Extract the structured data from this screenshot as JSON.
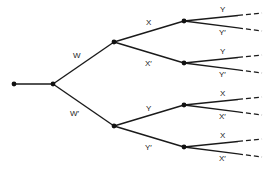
{
  "diagram": {
    "type": "probability-tree",
    "colors": {
      "line": "#1a1a1a",
      "node": "#111111",
      "label": "#222222",
      "background": "#ffffff"
    },
    "nodes": [
      {
        "id": "root",
        "x": 14,
        "y": 84
      },
      {
        "id": "split",
        "x": 53,
        "y": 84
      },
      {
        "id": "W",
        "x": 114,
        "y": 42
      },
      {
        "id": "Wp",
        "x": 114,
        "y": 126
      },
      {
        "id": "WX",
        "x": 184,
        "y": 21
      },
      {
        "id": "WXp",
        "x": 184,
        "y": 63
      },
      {
        "id": "WpY",
        "x": 184,
        "y": 105
      },
      {
        "id": "WpYp",
        "x": 184,
        "y": 147
      }
    ],
    "edges": [
      {
        "from": "root",
        "to": "split",
        "label": ""
      },
      {
        "from": "split",
        "to": "W",
        "label": "W",
        "lx": 73,
        "ly": 58
      },
      {
        "from": "split",
        "to": "Wp",
        "label": "W′",
        "lx": 70,
        "ly": 116
      },
      {
        "from": "W",
        "to": "WX",
        "label": "X",
        "lx": 146,
        "ly": 25
      },
      {
        "from": "W",
        "to": "WXp",
        "label": "X′",
        "lx": 145,
        "ly": 66
      },
      {
        "from": "Wp",
        "to": "WpY",
        "label": "Y",
        "lx": 146,
        "ly": 111
      },
      {
        "from": "Wp",
        "to": "WpYp",
        "label": "Y′",
        "lx": 145,
        "ly": 150
      }
    ],
    "leaves": [
      {
        "parent": "WX",
        "label": "Y",
        "y_end": 13,
        "lx": 220,
        "ly": 12
      },
      {
        "parent": "WX",
        "label": "Y′",
        "y_end": 31,
        "lx": 219,
        "ly": 35
      },
      {
        "parent": "WXp",
        "label": "Y",
        "y_end": 55,
        "lx": 220,
        "ly": 54
      },
      {
        "parent": "WXp",
        "label": "Y′",
        "y_end": 73,
        "lx": 219,
        "ly": 77
      },
      {
        "parent": "WpY",
        "label": "X",
        "y_end": 97,
        "lx": 220,
        "ly": 96
      },
      {
        "parent": "WpY",
        "label": "X′",
        "y_end": 115,
        "lx": 219,
        "ly": 119
      },
      {
        "parent": "WpYp",
        "label": "X",
        "y_end": 139,
        "lx": 220,
        "ly": 138
      },
      {
        "parent": "WpYp",
        "label": "X′",
        "y_end": 157,
        "lx": 219,
        "ly": 161
      }
    ],
    "labels": {
      "w": "W",
      "w_prime": "W′",
      "x": "X",
      "x_prime": "X′",
      "y": "Y",
      "y_prime": "Y′"
    }
  }
}
